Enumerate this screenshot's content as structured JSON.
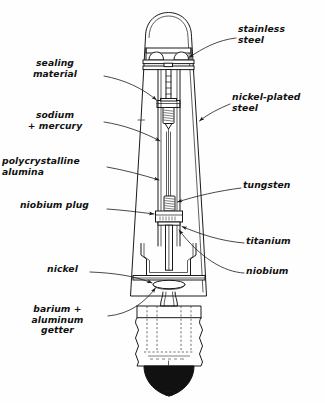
{
  "figure": {
    "style": "black-and-white technical line drawing",
    "width": 325,
    "height": 403,
    "line_color": "#1a1a1a",
    "background_color": "#ffffff"
  },
  "labels": {
    "stainless_steel": "stainless\nsteel",
    "nickel_plated_steel": "nickel-plated\nsteel",
    "tungsten": "tungsten",
    "titanium": "titanium",
    "niobium": "niobium",
    "sealing_material": "sealing\nmaterial",
    "sodium_mercury": "sodium\n+ mercury",
    "polycrystalline_alumina": "polycrystalline\nalumina",
    "niobium_plug": "niobium plug",
    "nickel": "nickel",
    "barium_aluminum_getter": "barium +\naluminum\ngetter"
  }
}
